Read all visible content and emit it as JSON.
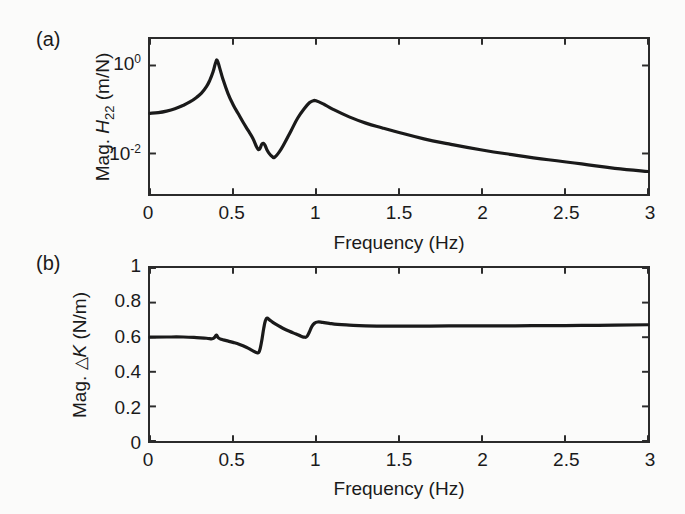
{
  "figure": {
    "background": "#fbfbfa",
    "ink_color": "#2b2b2b",
    "panels": [
      {
        "letter": "(a)",
        "xlabel": "Frequency (Hz)",
        "ylabel_parts": {
          "prefix": "Mag. ",
          "symbol": "H",
          "subscript": "22",
          "units": " (m/N)"
        },
        "ylabel_plain": "Mag. H22 (m/N)",
        "xticks": [
          "0",
          "0.5",
          "1",
          "1.5",
          "2",
          "2.5",
          "3"
        ],
        "yticks": [
          {
            "mantissa": "10",
            "exponent": "0"
          },
          {
            "mantissa": "10",
            "exponent": "-2"
          }
        ]
      },
      {
        "letter": "(b)",
        "xlabel": "Frequency (Hz)",
        "ylabel_parts": {
          "prefix": "Mag. ",
          "symbol": "K",
          "delta": "△",
          "units": " (N/m)"
        },
        "ylabel_plain": "Mag. △ K (N/m)",
        "xticks": [
          "0",
          "0.5",
          "1",
          "1.5",
          "2",
          "2.5",
          "3"
        ],
        "yticks": [
          "0",
          "0.2",
          "0.4",
          "0.6",
          "0.8",
          "1"
        ]
      }
    ]
  },
  "chart_data": [
    {
      "type": "line",
      "panel": "(a)",
      "title": "",
      "xlabel": "Frequency (Hz)",
      "ylabel": "Mag. H22 (m/N)",
      "xlim": [
        0,
        3
      ],
      "ylim": [
        0.0012,
        4.0
      ],
      "yscale": "log",
      "xscale": "linear",
      "grid": false,
      "legend": null,
      "xticks": [
        0,
        0.5,
        1,
        1.5,
        2,
        2.5,
        3
      ],
      "yticks": [
        1,
        0.01
      ],
      "ytick_labels": [
        "10^0",
        "10^-2"
      ],
      "series": [
        {
          "name": "H22 magnitude",
          "color": "#1a1a1a",
          "x": [
            0.0,
            0.05,
            0.1,
            0.15,
            0.2,
            0.24,
            0.28,
            0.31,
            0.34,
            0.36,
            0.38,
            0.395,
            0.405,
            0.42,
            0.44,
            0.47,
            0.5,
            0.53,
            0.56,
            0.59,
            0.62,
            0.645,
            0.66,
            0.675,
            0.69,
            0.705,
            0.72,
            0.735,
            0.75,
            0.78,
            0.81,
            0.85,
            0.89,
            0.93,
            0.96,
            0.98,
            1.0,
            1.05,
            1.1,
            1.2,
            1.3,
            1.4,
            1.5,
            1.65,
            1.8,
            2.0,
            2.2,
            2.4,
            2.6,
            2.8,
            3.0
          ],
          "y": [
            0.082,
            0.085,
            0.092,
            0.104,
            0.124,
            0.148,
            0.188,
            0.235,
            0.33,
            0.46,
            0.72,
            1.15,
            1.3,
            0.87,
            0.48,
            0.23,
            0.13,
            0.082,
            0.052,
            0.034,
            0.022,
            0.0135,
            0.0125,
            0.0165,
            0.016,
            0.012,
            0.0098,
            0.0086,
            0.0082,
            0.011,
            0.017,
            0.033,
            0.064,
            0.105,
            0.142,
            0.156,
            0.158,
            0.13,
            0.102,
            0.068,
            0.049,
            0.038,
            0.03,
            0.0215,
            0.0165,
            0.012,
            0.0092,
            0.0072,
            0.0058,
            0.0046,
            0.0039
          ]
        }
      ]
    },
    {
      "type": "line",
      "panel": "(b)",
      "title": "",
      "xlabel": "Frequency (Hz)",
      "ylabel": "Mag. △ K (N/m)",
      "xlim": [
        0,
        3
      ],
      "ylim": [
        0,
        1
      ],
      "yscale": "linear",
      "xscale": "linear",
      "grid": false,
      "legend": null,
      "xticks": [
        0,
        0.5,
        1,
        1.5,
        2,
        2.5,
        3
      ],
      "yticks": [
        0,
        0.2,
        0.4,
        0.6,
        0.8,
        1
      ],
      "series": [
        {
          "name": "Delta K magnitude",
          "color": "#1a1a1a",
          "x": [
            0.0,
            0.1,
            0.2,
            0.28,
            0.34,
            0.375,
            0.39,
            0.4,
            0.412,
            0.43,
            0.46,
            0.5,
            0.54,
            0.58,
            0.615,
            0.64,
            0.655,
            0.665,
            0.675,
            0.685,
            0.695,
            0.705,
            0.72,
            0.74,
            0.77,
            0.8,
            0.84,
            0.88,
            0.91,
            0.93,
            0.945,
            0.96,
            0.975,
            0.99,
            1.01,
            1.04,
            1.08,
            1.13,
            1.2,
            1.3,
            1.45,
            1.6,
            1.8,
            2.0,
            2.2,
            2.4,
            2.6,
            2.8,
            3.0
          ],
          "y": [
            0.6,
            0.601,
            0.601,
            0.598,
            0.594,
            0.591,
            0.6,
            0.612,
            0.596,
            0.588,
            0.58,
            0.57,
            0.558,
            0.542,
            0.524,
            0.512,
            0.512,
            0.54,
            0.59,
            0.65,
            0.695,
            0.71,
            0.7,
            0.686,
            0.668,
            0.652,
            0.634,
            0.618,
            0.606,
            0.6,
            0.604,
            0.63,
            0.662,
            0.68,
            0.688,
            0.686,
            0.68,
            0.674,
            0.67,
            0.666,
            0.664,
            0.664,
            0.665,
            0.665,
            0.666,
            0.667,
            0.668,
            0.67,
            0.672
          ]
        }
      ]
    }
  ]
}
